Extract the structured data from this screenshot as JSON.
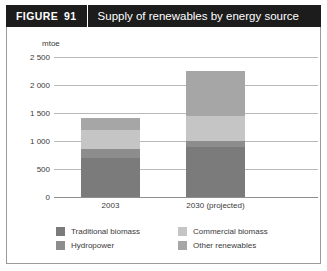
{
  "figure": {
    "label": "FIGURE",
    "number": "91",
    "title": "Supply of renewables by energy source"
  },
  "chart_data": {
    "type": "bar",
    "stacked": true,
    "title": "Supply of renewables by energy source",
    "xlabel": "",
    "ylabel": "mtoe",
    "unit_label": "mtoe",
    "categories": [
      "2003",
      "2030 (projected)"
    ],
    "ytick_labels": [
      "2 500",
      "2 000",
      "1 500",
      "1 000",
      "500",
      "0"
    ],
    "ytick_values": [
      2500,
      2000,
      1500,
      1000,
      500,
      0
    ],
    "ylim": [
      0,
      2500
    ],
    "grid": true,
    "legend_position": "bottom",
    "series": [
      {
        "name": "Traditional biomass",
        "color": "#7b7b7b",
        "values": [
          700,
          900
        ]
      },
      {
        "name": "Hydropower",
        "color": "#8d8d8d",
        "values": [
          150,
          100
        ]
      },
      {
        "name": "Commercial biomass",
        "color": "#c5c5c5",
        "values": [
          350,
          450
        ]
      },
      {
        "name": "Other renewables",
        "color": "#a6a6a6",
        "values": [
          210,
          800
        ]
      }
    ],
    "totals": [
      1410,
      2250
    ]
  },
  "colors": {
    "header_bg": "#1c1c1c",
    "header_text": "#ffffff",
    "frame_border": "#9a9a9a",
    "gridline": "#b9b9b9",
    "axis": "#8e8e8e",
    "tick_text": "#3a3a3a",
    "traditional_biomass": "#7b7b7b",
    "hydropower": "#8d8d8d",
    "commercial_biomass": "#c5c5c5",
    "other_renewables": "#a6a6a6"
  },
  "legend": {
    "entries": [
      {
        "label": "Traditional biomass",
        "color": "#7b7b7b"
      },
      {
        "label": "Commercial biomass",
        "color": "#c5c5c5"
      },
      {
        "label": "Hydropower",
        "color": "#8d8d8d"
      },
      {
        "label": "Other renewables",
        "color": "#a6a6a6"
      }
    ]
  }
}
